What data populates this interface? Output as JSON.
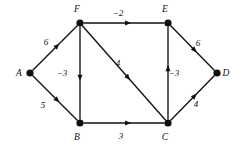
{
  "figure": {
    "type": "directed-weighted-graph",
    "background_color": "#ffffff",
    "ink_color": "#101010"
  },
  "nodes": [
    {
      "id": "A",
      "label": "A",
      "x": 30,
      "y": 73,
      "label_x": 19,
      "label_y": 76
    },
    {
      "id": "B",
      "label": "B",
      "x": 80,
      "y": 123,
      "label_x": 77,
      "label_y": 140
    },
    {
      "id": "C",
      "label": "C",
      "x": 168,
      "y": 123,
      "label_x": 165,
      "label_y": 140
    },
    {
      "id": "D",
      "label": "D",
      "x": 217,
      "y": 73,
      "label_x": 226,
      "label_y": 76
    },
    {
      "id": "E",
      "label": "E",
      "x": 168,
      "y": 23,
      "label_x": 165,
      "label_y": 12
    },
    {
      "id": "F",
      "label": "F",
      "x": 80,
      "y": 23,
      "label_x": 77,
      "label_y": 12
    }
  ],
  "edges": [
    {
      "id": "A-F",
      "from": "A",
      "to": "F",
      "weight": "6",
      "label_x": 46,
      "label_y": 45
    },
    {
      "id": "A-B",
      "from": "A",
      "to": "B",
      "weight": "5",
      "label_x": 43,
      "label_y": 108
    },
    {
      "id": "F-B",
      "from": "F",
      "to": "B",
      "weight": "-3",
      "label_x": 62,
      "label_y": 76
    },
    {
      "id": "F-E",
      "from": "F",
      "to": "E",
      "weight": "-2",
      "label_x": 118,
      "label_y": 16
    },
    {
      "id": "F-C",
      "from": "F",
      "to": "C",
      "weight": "4",
      "label_x": 118,
      "label_y": 66
    },
    {
      "id": "B-C",
      "from": "B",
      "to": "C",
      "weight": "3",
      "label_x": 121,
      "label_y": 139
    },
    {
      "id": "C-E",
      "from": "C",
      "to": "E",
      "weight": "-3",
      "label_x": 174,
      "label_y": 76
    },
    {
      "id": "C-D",
      "from": "C",
      "to": "D",
      "weight": "4",
      "label_x": 196,
      "label_y": 107
    },
    {
      "id": "E-D",
      "from": "E",
      "to": "D",
      "weight": "6",
      "label_x": 198,
      "label_y": 46
    }
  ],
  "chart_data": {
    "type": "table",
    "title": "",
    "vertices": [
      "A",
      "B",
      "C",
      "D",
      "E",
      "F"
    ],
    "directed": true,
    "weighted": true,
    "edge_list": [
      {
        "source": "A",
        "target": "F",
        "weight": 6
      },
      {
        "source": "A",
        "target": "B",
        "weight": 5
      },
      {
        "source": "F",
        "target": "B",
        "weight": -3
      },
      {
        "source": "F",
        "target": "E",
        "weight": -2
      },
      {
        "source": "F",
        "target": "C",
        "weight": 4
      },
      {
        "source": "B",
        "target": "C",
        "weight": 3
      },
      {
        "source": "C",
        "target": "E",
        "weight": -3
      },
      {
        "source": "C",
        "target": "D",
        "weight": 4
      },
      {
        "source": "E",
        "target": "D",
        "weight": 6
      }
    ]
  }
}
